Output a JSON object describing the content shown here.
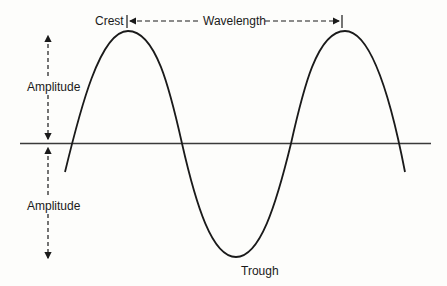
{
  "diagram": {
    "labels": {
      "crest": "Crest",
      "wavelength": "Wavelength",
      "amplitude_top": "Amplitude",
      "amplitude_bottom": "Amplitude",
      "trough": "Trough"
    },
    "colors": {
      "line": "#1a1a1a",
      "axis": "#3a3a3a",
      "background": "#fdfdfb"
    }
  }
}
